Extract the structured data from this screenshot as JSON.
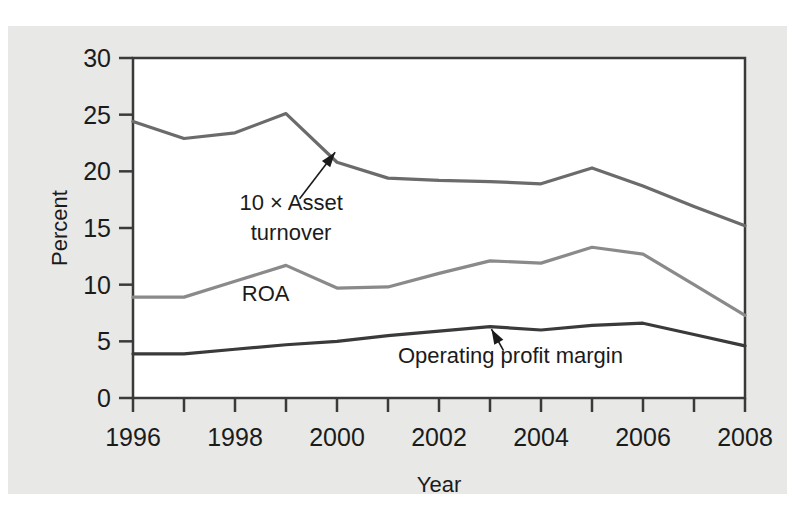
{
  "chart_data": {
    "type": "line",
    "title": "",
    "xlabel": "Year",
    "ylabel": "Percent",
    "x": [
      1996,
      1997,
      1998,
      1999,
      2000,
      2001,
      2002,
      2003,
      2004,
      2005,
      2006,
      2007,
      2008
    ],
    "xlim": [
      1996,
      2008
    ],
    "ylim": [
      0,
      30
    ],
    "xticks": [
      1996,
      1997,
      1998,
      1999,
      2000,
      2001,
      2002,
      2003,
      2004,
      2005,
      2006,
      2007,
      2008
    ],
    "xtick_labels": [
      "1996",
      "",
      "1998",
      "",
      "2000",
      "",
      "2002",
      "",
      "2004",
      "",
      "2006",
      "",
      "2008"
    ],
    "yticks": [
      0,
      5,
      10,
      15,
      20,
      25,
      30
    ],
    "ytick_labels": [
      "0",
      "5",
      "10",
      "15",
      "20",
      "25",
      "30"
    ],
    "grid": false,
    "legend": "none",
    "series": [
      {
        "name": "10 × Asset turnover",
        "color": "#6b6b6b",
        "values": [
          24.4,
          22.9,
          23.4,
          25.1,
          20.8,
          19.4,
          19.2,
          19.1,
          18.9,
          20.3,
          18.7,
          16.9,
          15.2
        ]
      },
      {
        "name": "ROA",
        "color": "#8a8a8a",
        "values": [
          8.9,
          8.9,
          10.3,
          11.7,
          9.7,
          9.8,
          11.0,
          12.1,
          11.9,
          13.3,
          12.7,
          10.0,
          7.3
        ]
      },
      {
        "name": "Operating profit margin",
        "color": "#3a3a3a",
        "values": [
          3.9,
          3.9,
          4.3,
          4.7,
          5.0,
          5.5,
          5.9,
          6.3,
          6.0,
          6.4,
          6.6,
          5.6,
          4.6
        ]
      }
    ],
    "annotations": [
      {
        "text_line1": "10 × Asset",
        "text_line2": "turnover",
        "target_x": 2000,
        "target_y": 21.9,
        "label_x": 1999.1,
        "label_y": 16.6
      },
      {
        "text_line1": "Operating profit margin",
        "text_line2": "",
        "target_x": 2003,
        "target_y": 6.3,
        "label_x": 2003.4,
        "label_y": 3.1
      },
      {
        "text_line1": "ROA",
        "text_line2": "",
        "target_x": null,
        "target_y": null,
        "label_x": 1998.6,
        "label_y": 8.6
      }
    ]
  },
  "axes": {
    "y_axis_title": "Percent",
    "x_axis_title": "Year"
  },
  "colors": {
    "background": "#ffffff",
    "paper": "#e8e8e6",
    "plot_area": "#ffffff",
    "axis": "#3a3a3a",
    "text": "#1b1b1b"
  }
}
